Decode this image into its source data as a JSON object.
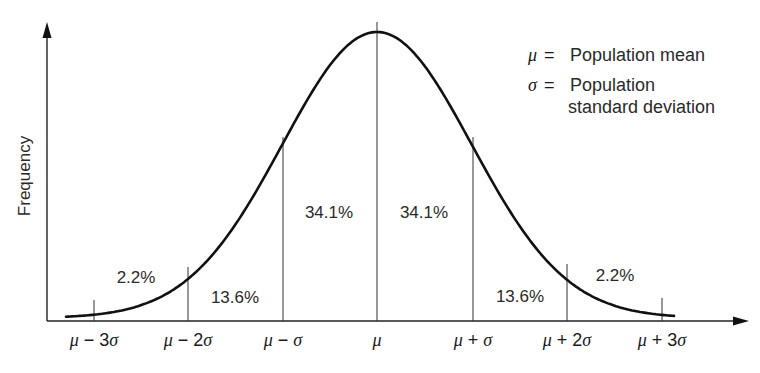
{
  "chart_data": {
    "type": "line",
    "title": "",
    "xlabel": "",
    "ylabel": "Frequency",
    "grid": false,
    "curve": "normal distribution (bell curve)",
    "x_ticks": [
      {
        "mu": "μ",
        "op": "−",
        "k": "3",
        "sigma": "σ",
        "label": "μ − 3σ",
        "z": -3
      },
      {
        "mu": "μ",
        "op": "−",
        "k": "2",
        "sigma": "σ",
        "label": "μ − 2σ",
        "z": -2
      },
      {
        "mu": "μ",
        "op": "−",
        "k": "",
        "sigma": "σ",
        "label": "μ − σ",
        "z": -1
      },
      {
        "mu": "μ",
        "op": "",
        "k": "",
        "sigma": "",
        "label": "μ",
        "z": 0
      },
      {
        "mu": "μ",
        "op": "+",
        "k": "",
        "sigma": "σ",
        "label": "μ + σ",
        "z": 1
      },
      {
        "mu": "μ",
        "op": "+",
        "k": "2",
        "sigma": "σ",
        "label": "μ + 2σ",
        "z": 2
      },
      {
        "mu": "μ",
        "op": "+",
        "k": "3",
        "sigma": "σ",
        "label": "μ + 3σ",
        "z": 3
      }
    ],
    "regions": [
      {
        "from": -3,
        "to": -2,
        "label": "2.2%",
        "value": 2.2
      },
      {
        "from": -2,
        "to": -1,
        "label": "13.6%",
        "value": 13.6
      },
      {
        "from": -1,
        "to": 0,
        "label": "34.1%",
        "value": 34.1
      },
      {
        "from": 0,
        "to": 1,
        "label": "34.1%",
        "value": 34.1
      },
      {
        "from": 1,
        "to": 2,
        "label": "13.6%",
        "value": 13.6
      },
      {
        "from": 2,
        "to": 3,
        "label": "2.2%",
        "value": 2.2
      }
    ],
    "legend": {
      "position": "top-right",
      "entries": [
        {
          "symbol": "μ",
          "eq": "=",
          "text": "Population mean"
        },
        {
          "symbol": "σ",
          "eq": "=",
          "text_line1": "Population",
          "text_line2": "standard deviation"
        }
      ]
    }
  }
}
